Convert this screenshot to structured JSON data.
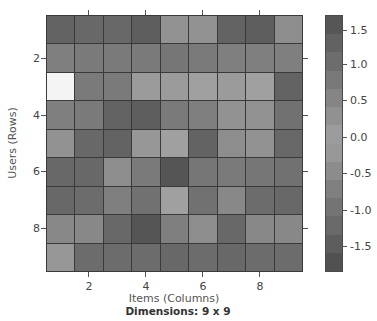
{
  "chart_data": {
    "type": "heatmap",
    "title": "",
    "xlabel": "Items (Columns)",
    "ylabel": "Users (Rows)",
    "footer": "Dimensions: 9 x 9",
    "x_ticks": [
      2,
      4,
      6,
      8
    ],
    "y_ticks": [
      2,
      4,
      6,
      8
    ],
    "rows": 9,
    "cols": 9,
    "colorbar": {
      "ticks": [
        "1.5",
        "1.0",
        "0.5",
        "0.0",
        "-0.5",
        "-1.0",
        "-1.5"
      ],
      "range": [
        -1.8,
        1.7
      ],
      "colormap": "diverging (rendered grayscale): light near 0, dark at extremes"
    },
    "values": [
      [
        1.3,
        1.2,
        1.2,
        1.4,
        0.3,
        0.3,
        1.3,
        1.4,
        0.4
      ],
      [
        0.7,
        0.8,
        0.8,
        0.8,
        0.9,
        0.8,
        0.7,
        0.7,
        0.7
      ],
      [
        null,
        0.8,
        0.8,
        0.1,
        0.1,
        0.0,
        0.1,
        0.0,
        -1.3
      ],
      [
        -0.7,
        -0.8,
        -1.3,
        -1.4,
        -0.8,
        -0.7,
        -0.3,
        -0.3,
        -1.0
      ],
      [
        -0.3,
        -1.2,
        -1.3,
        -0.2,
        0.0,
        -1.3,
        -0.4,
        -0.3,
        -1.2
      ],
      [
        -1.2,
        -1.2,
        -0.4,
        -0.8,
        -1.6,
        -0.9,
        -0.8,
        -0.9,
        -1.0
      ],
      [
        -1.2,
        -1.1,
        -0.7,
        -1.0,
        0.0,
        -1.0,
        -0.5,
        -1.1,
        -1.2
      ],
      [
        -0.5,
        -0.5,
        -1.2,
        -1.6,
        -0.7,
        -0.4,
        -1.2,
        -0.5,
        -0.5
      ],
      [
        -0.2,
        -1.1,
        -1.1,
        -1.1,
        -1.2,
        -1.1,
        -1.2,
        -1.1,
        -1.1
      ]
    ]
  },
  "labels": {
    "xlabel": "Items (Columns)",
    "ylabel": "Users (Rows)",
    "footer": "Dimensions: 9 x 9",
    "xticks": [
      "2",
      "4",
      "6",
      "8"
    ],
    "yticks": [
      "2",
      "4",
      "6",
      "8"
    ],
    "cbticks": [
      "1.5",
      "1.0",
      "0.5",
      "0.0",
      "-0.5",
      "-1.0",
      "-1.5"
    ]
  }
}
